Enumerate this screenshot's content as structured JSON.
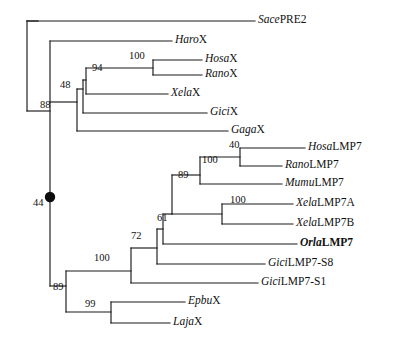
{
  "figure": {
    "type": "phylogenetic-tree",
    "style": "rectangular-cladogram",
    "width": 407,
    "height": 339,
    "background_color": "#ffffff",
    "line_color": "#1a1a1a",
    "node_marker_color": "#0d0d0d"
  },
  "tips": [
    {
      "id": "sace-pre2",
      "genus": "Sace",
      "gene": "PRE2",
      "bold": false,
      "x_tip": 255,
      "y": 21,
      "label_x": 258,
      "label_y": 14
    },
    {
      "id": "haro-x",
      "genus": "Haro",
      "gene": "X",
      "bold": false,
      "x_tip": 172,
      "y": 41,
      "label_x": 175,
      "label_y": 34
    },
    {
      "id": "hosa-x",
      "genus": "Hosa",
      "gene": "X",
      "bold": false,
      "x_tip": 202,
      "y": 60,
      "label_x": 205,
      "label_y": 53
    },
    {
      "id": "rano-x",
      "genus": "Rano",
      "gene": "X",
      "bold": false,
      "x_tip": 202,
      "y": 75,
      "label_x": 205,
      "label_y": 68
    },
    {
      "id": "xela-x",
      "genus": "Xela",
      "gene": "X",
      "bold": false,
      "x_tip": 168,
      "y": 94,
      "label_x": 171,
      "label_y": 87
    },
    {
      "id": "gici-x",
      "genus": "Gici",
      "gene": "X",
      "bold": false,
      "x_tip": 207,
      "y": 113,
      "label_x": 210,
      "label_y": 106
    },
    {
      "id": "gaga-x",
      "genus": "Gaga",
      "gene": "X",
      "bold": false,
      "x_tip": 228,
      "y": 131,
      "label_x": 231,
      "label_y": 124
    },
    {
      "id": "hosa-lmp7",
      "genus": "Hosa",
      "gene": "LMP7",
      "bold": false,
      "x_tip": 305,
      "y": 148,
      "label_x": 308,
      "label_y": 141
    },
    {
      "id": "rano-lmp7",
      "genus": "Rano",
      "gene": "LMP7",
      "bold": false,
      "x_tip": 282,
      "y": 166,
      "label_x": 285,
      "label_y": 159
    },
    {
      "id": "mumu-lmp7",
      "genus": "Mumu",
      "gene": "LMP7",
      "bold": false,
      "x_tip": 282,
      "y": 184,
      "label_x": 285,
      "label_y": 177
    },
    {
      "id": "xela-lmp7a",
      "genus": "Xela",
      "gene": "LMP7A",
      "bold": false,
      "x_tip": 293,
      "y": 204,
      "label_x": 296,
      "label_y": 197
    },
    {
      "id": "xela-lmp7b",
      "genus": "Xela",
      "gene": "LMP7B",
      "bold": false,
      "x_tip": 293,
      "y": 224,
      "label_x": 296,
      "label_y": 217
    },
    {
      "id": "orla-lmp7",
      "genus": "Orla",
      "gene": "LMP7",
      "bold": true,
      "x_tip": 297,
      "y": 244,
      "label_x": 300,
      "label_y": 237
    },
    {
      "id": "gici-lmp7-s8",
      "genus": "Gici",
      "gene": "LMP7-S8",
      "bold": false,
      "x_tip": 265,
      "y": 264,
      "label_x": 268,
      "label_y": 257
    },
    {
      "id": "gici-lmp7-s1",
      "genus": "Gici",
      "gene": "LMP7-S1",
      "bold": false,
      "x_tip": 258,
      "y": 283,
      "label_x": 261,
      "label_y": 276
    },
    {
      "id": "epbu-x",
      "genus": "Epbu",
      "gene": "X",
      "bold": false,
      "x_tip": 185,
      "y": 302,
      "label_x": 188,
      "label_y": 295
    },
    {
      "id": "laja-x",
      "genus": "Laja",
      "gene": "X",
      "bold": false,
      "x_tip": 170,
      "y": 323,
      "label_x": 173,
      "label_y": 316
    }
  ],
  "support_values": [
    {
      "id": "support-100-hosax-ranox",
      "value": "100",
      "x": 129,
      "y": 51,
      "anchor_node": "hosax-ranox"
    },
    {
      "id": "support-94-mammal-xela",
      "value": "94",
      "x": 92,
      "y": 63,
      "anchor_node": "x-vertebrate"
    },
    {
      "id": "support-48-xclade",
      "value": "48",
      "x": 60,
      "y": 80,
      "anchor_node": "x-plus-gicix"
    },
    {
      "id": "support-88-xclade-gagax",
      "value": "88",
      "x": 40,
      "y": 100,
      "anchor_node": "x-plus-gagax"
    },
    {
      "id": "support-40-hosa-rano",
      "value": "40",
      "x": 229,
      "y": 140,
      "anchor_node": "hosa-rano-lmp7"
    },
    {
      "id": "support-100-rodent-primate",
      "value": "100",
      "x": 202,
      "y": 155,
      "anchor_node": "mammal-lmp7"
    },
    {
      "id": "support-89-mammal-xela",
      "value": "89",
      "x": 178,
      "y": 170,
      "anchor_node": "tetrapod-lmp7"
    },
    {
      "id": "support-100-xela-ab",
      "value": "100",
      "x": 230,
      "y": 195,
      "anchor_node": "xela-lmp7-pair"
    },
    {
      "id": "support-61-orla",
      "value": "61",
      "x": 157,
      "y": 213,
      "anchor_node": "orla-join"
    },
    {
      "id": "support-72-gicis8",
      "value": "72",
      "x": 131,
      "y": 231,
      "anchor_node": "gici-s8-join"
    },
    {
      "id": "support-100-lmp7clade",
      "value": "100",
      "x": 94,
      "y": 253,
      "anchor_node": "lmp7-clade"
    },
    {
      "id": "support-89-lower",
      "value": "89",
      "x": 53,
      "y": 282,
      "anchor_node": "lower-clade"
    },
    {
      "id": "support-99-epbu-laja",
      "value": "99",
      "x": 85,
      "y": 299,
      "anchor_node": "epbu-laja"
    },
    {
      "id": "support-44-root-node",
      "value": "44",
      "x": 33,
      "y": 198,
      "anchor_node": "marked-node"
    }
  ],
  "node_markers": [
    {
      "id": "marked-node",
      "shape": "filled-circle",
      "x": 50,
      "y": 197,
      "radius": 5.2
    }
  ],
  "edges": [
    {
      "id": "root-stem",
      "type": "h",
      "x1": 27,
      "x2": 38,
      "y": 21
    },
    {
      "id": "root-vertical",
      "type": "v",
      "x": 27,
      "y1": 21,
      "y2": 111
    },
    {
      "id": "sace-branch",
      "type": "h",
      "x1": 27,
      "x2": 255,
      "y": 21
    },
    {
      "id": "node-b-stem",
      "type": "h",
      "x1": 27,
      "x2": 50,
      "y": 111
    },
    {
      "id": "node-b-vertical",
      "type": "v",
      "x": 50,
      "y1": 41,
      "y2": 286
    },
    {
      "id": "haro-branch",
      "type": "h",
      "x1": 50,
      "x2": 172,
      "y": 41
    },
    {
      "id": "xclade-stem",
      "type": "h",
      "x1": 50,
      "x2": 77,
      "y": 102
    },
    {
      "id": "xclade-vertical",
      "type": "v",
      "x": 77,
      "y1": 89,
      "y2": 131
    },
    {
      "id": "gagax-branch",
      "type": "h",
      "x1": 77,
      "x2": 228,
      "y": 131
    },
    {
      "id": "x48-stem",
      "type": "h",
      "x1": 77,
      "x2": 83,
      "y": 89
    },
    {
      "id": "x48-vertical",
      "type": "v",
      "x": 83,
      "y1": 80,
      "y2": 113
    },
    {
      "id": "gicix-branch",
      "type": "h",
      "x1": 83,
      "x2": 207,
      "y": 113
    },
    {
      "id": "x94-stem",
      "type": "h",
      "x1": 83,
      "x2": 86,
      "y": 80
    },
    {
      "id": "x94-vertical",
      "type": "v",
      "x": 86,
      "y1": 68,
      "y2": 94
    },
    {
      "id": "xelax-branch",
      "type": "h",
      "x1": 86,
      "x2": 168,
      "y": 94
    },
    {
      "id": "x100-stem",
      "type": "h",
      "x1": 86,
      "x2": 153,
      "y": 68
    },
    {
      "id": "x100-vertical",
      "type": "v",
      "x": 153,
      "y1": 60,
      "y2": 75
    },
    {
      "id": "hosax-branch",
      "type": "h",
      "x1": 153,
      "x2": 202,
      "y": 60
    },
    {
      "id": "ranox-branch",
      "type": "h",
      "x1": 153,
      "x2": 202,
      "y": 75
    },
    {
      "id": "lower-stem",
      "type": "h",
      "x1": 50,
      "x2": 66,
      "y": 286
    },
    {
      "id": "lower-vertical",
      "type": "v",
      "x": 66,
      "y1": 271,
      "y2": 312
    },
    {
      "id": "lmp7-clade-stem",
      "type": "h",
      "x1": 66,
      "x2": 131,
      "y": 271
    },
    {
      "id": "lmp7-clade-vertical",
      "type": "v",
      "x": 131,
      "y1": 248,
      "y2": 283
    },
    {
      "id": "gici-s1-branch",
      "type": "h",
      "x1": 131,
      "x2": 258,
      "y": 283
    },
    {
      "id": "node72-stem",
      "type": "h",
      "x1": 131,
      "x2": 157,
      "y": 248
    },
    {
      "id": "node72-vertical",
      "type": "v",
      "x": 157,
      "y1": 229,
      "y2": 264
    },
    {
      "id": "gici-s8-branch",
      "type": "h",
      "x1": 157,
      "x2": 265,
      "y": 264
    },
    {
      "id": "node61-stem",
      "type": "h",
      "x1": 157,
      "x2": 163,
      "y": 229
    },
    {
      "id": "node61-vertical",
      "type": "v",
      "x": 163,
      "y1": 214,
      "y2": 244
    },
    {
      "id": "orla-branch",
      "type": "h",
      "x1": 163,
      "x2": 297,
      "y": 244
    },
    {
      "id": "node89-stem",
      "type": "h",
      "x1": 163,
      "x2": 172,
      "y": 214
    },
    {
      "id": "node89-vertical",
      "type": "v",
      "x": 172,
      "y1": 175,
      "y2": 214
    },
    {
      "id": "xela-pair-stem",
      "type": "h",
      "x1": 172,
      "x2": 222,
      "y": 214
    },
    {
      "id": "xela-pair-vertical",
      "type": "v",
      "x": 222,
      "y1": 204,
      "y2": 224
    },
    {
      "id": "xela-a-branch",
      "type": "h",
      "x1": 222,
      "x2": 293,
      "y": 204
    },
    {
      "id": "xela-b-branch",
      "type": "h",
      "x1": 222,
      "x2": 293,
      "y": 224
    },
    {
      "id": "mammal-stem",
      "type": "h",
      "x1": 172,
      "x2": 200,
      "y": 175
    },
    {
      "id": "mammal-vertical",
      "type": "v",
      "x": 200,
      "y1": 157,
      "y2": 184
    },
    {
      "id": "mumu-branch",
      "type": "h",
      "x1": 200,
      "x2": 282,
      "y": 184
    },
    {
      "id": "hosa-rano-stem",
      "type": "h",
      "x1": 200,
      "x2": 240,
      "y": 157
    },
    {
      "id": "hosa-rano-vertical",
      "type": "v",
      "x": 240,
      "y1": 148,
      "y2": 166
    },
    {
      "id": "hosa-lmp7-branch",
      "type": "h",
      "x1": 240,
      "x2": 305,
      "y": 148
    },
    {
      "id": "rano-lmp7-branch",
      "type": "h",
      "x1": 240,
      "x2": 282,
      "y": 166
    },
    {
      "id": "epbu-laja-stem",
      "type": "h",
      "x1": 66,
      "x2": 111,
      "y": 312
    },
    {
      "id": "epbu-laja-vertical",
      "type": "v",
      "x": 111,
      "y1": 302,
      "y2": 323
    },
    {
      "id": "epbu-branch",
      "type": "h",
      "x1": 111,
      "x2": 185,
      "y": 302
    },
    {
      "id": "laja-branch",
      "type": "h",
      "x1": 111,
      "x2": 170,
      "y": 323
    }
  ]
}
